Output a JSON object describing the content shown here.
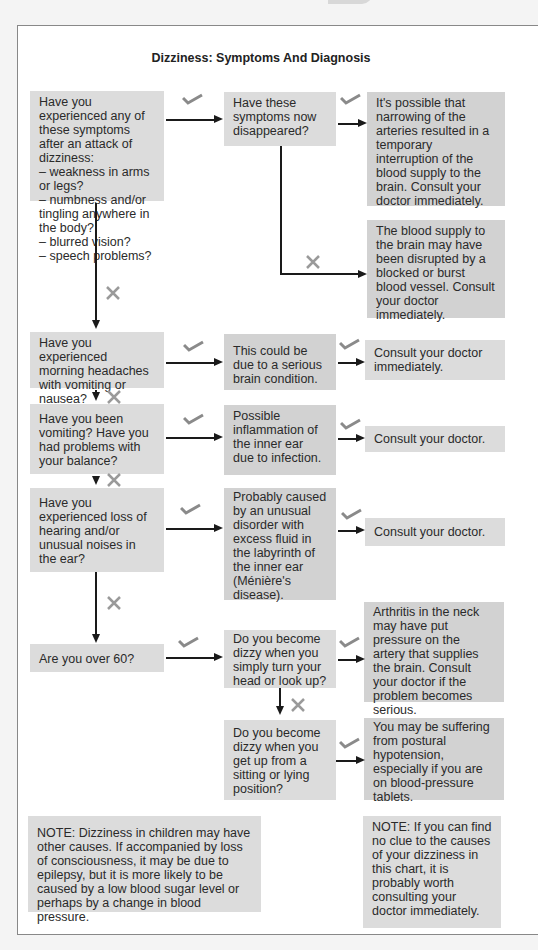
{
  "title": "Dizziness: Symptoms And Diagnosis",
  "colors": {
    "box": "#dcdcdc",
    "box_dark": "#d2d2d2",
    "line": "#1a1a1a",
    "mark": "#8a8a8a"
  },
  "icons": {
    "yes": "check-icon",
    "no": "cross-icon"
  },
  "nodes": {
    "q1": "Have you experienced any of these symptoms after an attack of dizziness:\n– weakness in arms or legs?\n– numbness and/or tingling anywhere in the body?\n– blurred vision?\n– speech problems?",
    "q1a": "Have these symptoms now disappeared?",
    "r1a": "It's possible that narrowing of the arteries resulted in a temporary interruption of the blood supply to the brain. Consult your doctor immediately.",
    "r1b": "The blood supply to the brain may have been disrupted by a blocked or burst blood vessel. Consult your doctor immediately.",
    "q2": "Have you experienced morning headaches with vomiting or nausea?",
    "d2": "This could be due to a serious brain condition.",
    "r2": "Consult your doctor immediately.",
    "q3": "Have you been vomiting? Have you had problems with your balance?",
    "d3": "Possible inflammation of the inner ear due to infection.",
    "r3": "Consult your doctor.",
    "q4": "Have you experienced loss of hearing and/or unusual noises in the ear?",
    "d4": "Probably caused by an unusual disorder with excess fluid in the labyrinth of the inner ear (Ménière's disease).",
    "r4": "Consult your doctor.",
    "q5": "Are you over 60?",
    "q5a": "Do you become dizzy when you simply turn your head or look up?",
    "r5a": "Arthritis in the neck may have put pressure on the artery that supplies the brain. Consult your doctor if the problem becomes serious.",
    "q5b": "Do you become dizzy when you get up from a sitting or lying position?",
    "r5b": "You may be suffering from postural hypotension, especially if you are on blood-pressure tablets."
  },
  "notes": {
    "left": "NOTE: Dizziness in children may have other causes. If accompanied by loss of consciousness, it may be due to epilepsy, but it is more likely to be caused by a low blood sugar level or perhaps by a change in blood pressure.",
    "right": "NOTE: If you can find no clue to the causes of your dizziness in this chart, it is probably worth consulting your doctor immediately."
  }
}
